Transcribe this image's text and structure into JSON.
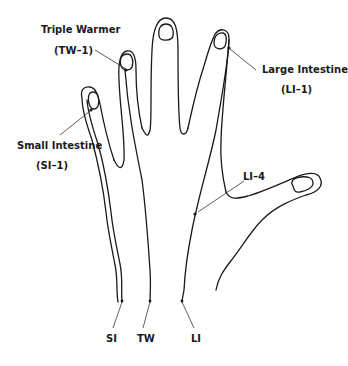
{
  "diagram": {
    "labels": {
      "triple_warmer_name": "Triple Warmer",
      "triple_warmer_code": "(TW–1)",
      "large_intestine_name": "Large Intestine",
      "large_intestine_code": "(LI–1)",
      "small_intestine_name": "Small Intestine",
      "small_intestine_code": "(SI–1)",
      "li4": "LI–4",
      "si_bottom": "SI",
      "tw_bottom": "TW",
      "li_bottom": "LI"
    },
    "colors": {
      "line": "#1a1a1a",
      "background": "#ffffff"
    }
  }
}
